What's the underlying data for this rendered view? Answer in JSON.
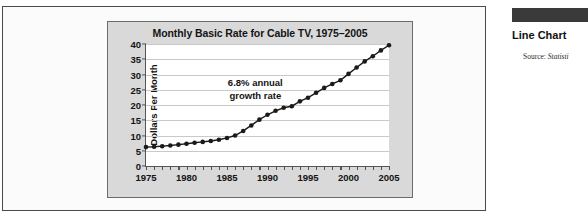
{
  "chart_data": {
    "type": "line",
    "title": "Monthly Basic Rate for Cable TV, 1975–2005",
    "xlabel": "",
    "ylabel": "Dollars Per Month",
    "xlim": [
      1975,
      2005
    ],
    "ylim": [
      0,
      40
    ],
    "ytick_labels": [
      "0",
      "5",
      "10",
      "15",
      "20",
      "25",
      "30",
      "35",
      "40"
    ],
    "ytick_values": [
      0,
      5,
      10,
      15,
      20,
      25,
      30,
      35,
      40
    ],
    "xtick_labels": [
      "1975",
      "1980",
      "1985",
      "1990",
      "1995",
      "2000",
      "2005"
    ],
    "xtick_values": [
      1975,
      1980,
      1985,
      1990,
      1995,
      2000,
      2005
    ],
    "x_minor_tick_step": 1,
    "grid": "horizontal",
    "legend": "none",
    "marker": "filled-circle",
    "line_color": "#1a1a1a",
    "annotations": [
      {
        "text_line1": "6.8% annual",
        "text_line2": "growth rate",
        "x": 1988.5,
        "y": 25
      }
    ],
    "x": [
      1975,
      1976,
      1977,
      1978,
      1979,
      1980,
      1981,
      1982,
      1983,
      1984,
      1985,
      1986,
      1987,
      1988,
      1989,
      1990,
      1991,
      1992,
      1993,
      1994,
      1995,
      1996,
      1997,
      1998,
      1999,
      2000,
      2001,
      2002,
      2003,
      2004,
      2005
    ],
    "values": [
      6.2,
      6.3,
      6.5,
      6.7,
      7.0,
      7.3,
      7.6,
      7.9,
      8.2,
      8.6,
      9.2,
      10.0,
      11.5,
      13.3,
      15.2,
      16.8,
      18.1,
      19.1,
      19.6,
      21.2,
      22.4,
      24.0,
      25.6,
      26.9,
      28.1,
      30.2,
      32.3,
      34.3,
      36.0,
      37.9,
      39.6
    ]
  },
  "sidebar": {
    "heading": "Line Chart",
    "source_prefix": "Source:",
    "source_body": "Statisti"
  }
}
